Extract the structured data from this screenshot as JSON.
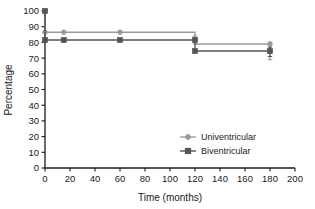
{
  "chart_data": {
    "type": "line",
    "title": "",
    "subtitle": "",
    "xlabel": "Time (months)",
    "ylabel": "Percentage",
    "xlim": [
      0,
      200
    ],
    "ylim": [
      0,
      100
    ],
    "xticks": [
      0,
      20,
      40,
      60,
      80,
      100,
      120,
      140,
      160,
      180,
      200
    ],
    "yticks": [
      0,
      10,
      20,
      30,
      40,
      50,
      60,
      70,
      80,
      90,
      100
    ],
    "grid": false,
    "legend_position": "middle-right",
    "step_style": "post",
    "series": [
      {
        "name": "Univentricular",
        "color": "#9a9a9a",
        "marker": "circle",
        "x": [
          0,
          0,
          15,
          60,
          120,
          120,
          180
        ],
        "y": [
          100,
          86.5,
          86.5,
          86.5,
          86.5,
          79,
          79
        ],
        "markers": [
          {
            "x": 0,
            "y": 100
          },
          {
            "x": 0,
            "y": 86.5
          },
          {
            "x": 15,
            "y": 86.5
          },
          {
            "x": 60,
            "y": 86.5
          },
          {
            "x": 120,
            "y": 82
          },
          {
            "x": 180,
            "y": 79
          }
        ],
        "error_bars": [
          {
            "x": 120,
            "y": 82,
            "low": 79,
            "high": 84
          },
          {
            "x": 180,
            "y": 79,
            "low": 69,
            "high": 80
          }
        ]
      },
      {
        "name": "Biventricular",
        "color": "#555555",
        "marker": "square",
        "x": [
          0,
          0,
          15,
          60,
          120,
          120,
          180
        ],
        "y": [
          100,
          81.5,
          81.5,
          81.5,
          81.5,
          74.5,
          74.5
        ],
        "markers": [
          {
            "x": 0,
            "y": 100
          },
          {
            "x": 0,
            "y": 81.5
          },
          {
            "x": 15,
            "y": 81.5
          },
          {
            "x": 60,
            "y": 81.5
          },
          {
            "x": 120,
            "y": 81.5
          },
          {
            "x": 120,
            "y": 74.5
          },
          {
            "x": 180,
            "y": 74.5
          }
        ],
        "error_bars": [
          {
            "x": 180,
            "y": 74.5,
            "low": 71,
            "high": 77
          }
        ]
      }
    ]
  },
  "axes": {
    "ylabel": "Percentage",
    "xlabel": "Time (months)",
    "ytick_labels": [
      "100",
      "90",
      "80",
      "70",
      "60",
      "50",
      "40",
      "30",
      "20",
      "10",
      "0"
    ],
    "xtick_labels": [
      "0",
      "20",
      "40",
      "60",
      "80",
      "100",
      "120",
      "140",
      "160",
      "180",
      "200"
    ]
  },
  "legend": {
    "items": [
      {
        "label": "Univentricular",
        "color": "#9a9a9a",
        "marker": "circle"
      },
      {
        "label": "Biventricular",
        "color": "#555555",
        "marker": "square"
      }
    ]
  },
  "colors": {
    "axis": "#1a1a1a",
    "text": "#1a1a1a",
    "background": "#ffffff",
    "univentricular": "#9a9a9a",
    "biventricular": "#555555"
  }
}
